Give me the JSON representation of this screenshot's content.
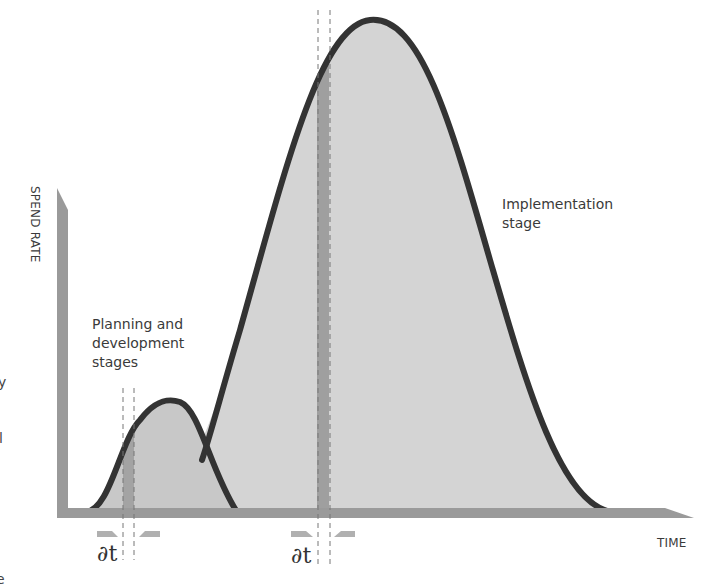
{
  "diagram": {
    "type": "spend-rate-curves",
    "axes": {
      "y_label": "SPEND RATE",
      "x_label": "TIME",
      "axis_color": "#9a9a9a"
    },
    "curves": [
      {
        "id": "planning",
        "label_lines": [
          "Planning and",
          "development",
          "stages"
        ],
        "peak_relative": 0.25,
        "fill_color": "#c8c8c8",
        "stroke_color": "#333333"
      },
      {
        "id": "implementation",
        "label_lines": [
          "Implementation",
          "stage"
        ],
        "peak_relative": 1.0,
        "fill_color": "#d4d4d4",
        "stroke_color": "#333333"
      }
    ],
    "intervals": [
      {
        "curve": "planning",
        "symbol": "∂t"
      },
      {
        "curve": "implementation",
        "symbol": "∂t"
      }
    ],
    "strip_color": "#9f9f9f",
    "edge_fragments": [
      "y",
      "l",
      "e"
    ]
  }
}
